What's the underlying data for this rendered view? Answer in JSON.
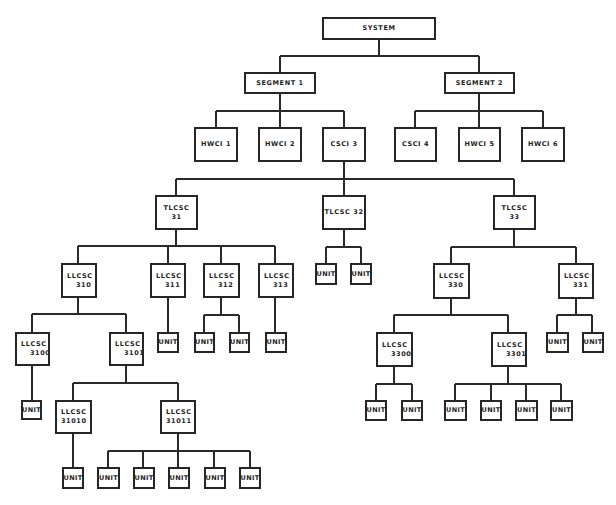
{
  "diagram": {
    "type": "hierarchy",
    "title": "",
    "nodes": {
      "system": "SYSTEM",
      "segment1": "SEGMENT 1",
      "segment2": "SEGMENT 2",
      "hwci1": "HWCI 1",
      "hwci2": "HWCI 2",
      "csci3": "CSCI 3",
      "csci4": "CSCI 4",
      "hwci5": "HWCI 5",
      "hwci6": "HWCI 6",
      "tlcsc31": "TLCSC 31",
      "tlcsc32": "TLCSC 32",
      "tlcsc33": "TLCSC 33",
      "llcsc310": {
        "type": "LLCSC",
        "num": "310"
      },
      "llcsc311": {
        "type": "LLCSC",
        "num": "311"
      },
      "llcsc312": {
        "type": "LLCSC",
        "num": "312"
      },
      "llcsc313": {
        "type": "LLCSC",
        "num": "313"
      },
      "llcsc330": {
        "type": "LLCSC",
        "num": "330"
      },
      "llcsc331": {
        "type": "LLCSC",
        "num": "331"
      },
      "llcsc3100": {
        "type": "LLCSC",
        "num": "3100"
      },
      "llcsc3101": {
        "type": "LLCSC",
        "num": "3101"
      },
      "llcsc3300": {
        "type": "LLCSC",
        "num": "3300"
      },
      "llcsc3301": {
        "type": "LLCSC",
        "num": "3301"
      },
      "llcsc31010": {
        "type": "LLCSC",
        "num": "31010"
      },
      "llcsc31011": {
        "type": "LLCSC",
        "num": "31011"
      }
    },
    "unit_label": "UNIT",
    "edges": [
      [
        "SYSTEM",
        "SEGMENT 1"
      ],
      [
        "SYSTEM",
        "SEGMENT 2"
      ],
      [
        "SEGMENT 1",
        "HWCI 1"
      ],
      [
        "SEGMENT 1",
        "HWCI 2"
      ],
      [
        "SEGMENT 1",
        "CSCI 3"
      ],
      [
        "SEGMENT 2",
        "CSCI 4"
      ],
      [
        "SEGMENT 2",
        "HWCI 5"
      ],
      [
        "SEGMENT 2",
        "HWCI 6"
      ],
      [
        "CSCI 3",
        "TLCSC 31"
      ],
      [
        "CSCI 3",
        "TLCSC 32"
      ],
      [
        "CSCI 3",
        "TLCSC 33"
      ],
      [
        "TLCSC 31",
        "LLCSC 310"
      ],
      [
        "TLCSC 31",
        "LLCSC 311"
      ],
      [
        "TLCSC 31",
        "LLCSC 312"
      ],
      [
        "TLCSC 31",
        "LLCSC 313"
      ],
      [
        "TLCSC 32",
        "UNIT x2"
      ],
      [
        "TLCSC 33",
        "LLCSC 330"
      ],
      [
        "TLCSC 33",
        "LLCSC 331"
      ],
      [
        "LLCSC 310",
        "LLCSC 3100"
      ],
      [
        "LLCSC 310",
        "LLCSC 3101"
      ],
      [
        "LLCSC 311",
        "UNIT x1"
      ],
      [
        "LLCSC 312",
        "UNIT x2"
      ],
      [
        "LLCSC 313",
        "UNIT x1"
      ],
      [
        "LLCSC 3100",
        "UNIT x1"
      ],
      [
        "LLCSC 3101",
        "LLCSC 31010"
      ],
      [
        "LLCSC 3101",
        "LLCSC 31011"
      ],
      [
        "LLCSC 31010",
        "UNIT x1"
      ],
      [
        "LLCSC 31011",
        "UNIT x5"
      ],
      [
        "LLCSC 330",
        "LLCSC 3300"
      ],
      [
        "LLCSC 330",
        "LLCSC 3301"
      ],
      [
        "LLCSC 331",
        "UNIT x2"
      ],
      [
        "LLCSC 3300",
        "UNIT x2"
      ],
      [
        "LLCSC 3301",
        "UNIT x4"
      ]
    ]
  }
}
